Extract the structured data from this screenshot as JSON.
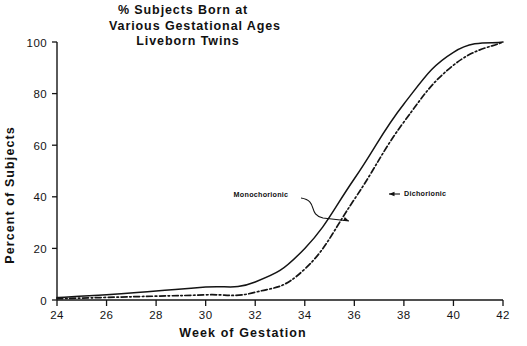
{
  "chart_data": {
    "type": "line",
    "title": "% Subjects Born at Various Gestational Ages Liveborn Twins",
    "title_lines": [
      "% Subjects Born at",
      "Various Gestational Ages",
      "Liveborn Twins"
    ],
    "xlabel": "Week of Gestation",
    "ylabel": "Percent of Subjects",
    "xlim": [
      24,
      42
    ],
    "ylim": [
      0,
      100
    ],
    "xticks": [
      24,
      26,
      28,
      30,
      32,
      34,
      36,
      38,
      40,
      42
    ],
    "yticks": [
      0,
      20,
      40,
      60,
      80,
      100
    ],
    "xtick_labels": [
      "24",
      "26",
      "28",
      "30",
      "32",
      "34",
      "36",
      "38",
      "40",
      "42"
    ],
    "ytick_labels": [
      "0",
      "20",
      "40",
      "60",
      "80",
      "100"
    ],
    "grid": false,
    "legend": "annotations-inline",
    "x": [
      24,
      26,
      28,
      30,
      32,
      34,
      36,
      38,
      40,
      42
    ],
    "series": [
      {
        "name": "Monochorionic",
        "style": "solid",
        "color": "#141414",
        "values": [
          1,
          2,
          3.5,
          5,
          7,
          20,
          47,
          76,
          96,
          100
        ]
      },
      {
        "name": "Dichorionic",
        "style": "dash-dot",
        "color": "#141414",
        "values": [
          0.5,
          1,
          1.5,
          2,
          3,
          12,
          39,
          69,
          91,
          100
        ]
      }
    ],
    "annotations": [
      {
        "label": "Monochorionic",
        "text_x": 261,
        "text_y": 197,
        "arrow": "curved-down-right",
        "target_x": 349,
        "target_y": 221
      },
      {
        "label": "Dichorionic",
        "text_x": 404,
        "text_y": 196,
        "arrow": "straight-left",
        "target_x": 389,
        "target_y": 196
      }
    ]
  },
  "geometry": {
    "plot_left": 57,
    "plot_right": 503,
    "plot_bottom": 300,
    "plot_top": 42,
    "title_x": 183,
    "title_line_y": [
      14,
      30,
      44
    ],
    "title_aligns": [
      "middle",
      "middle",
      "middle"
    ],
    "xlabel_x": 243,
    "xlabel_y": 337,
    "ylabel_x": 14,
    "ylabel_y": 195
  }
}
